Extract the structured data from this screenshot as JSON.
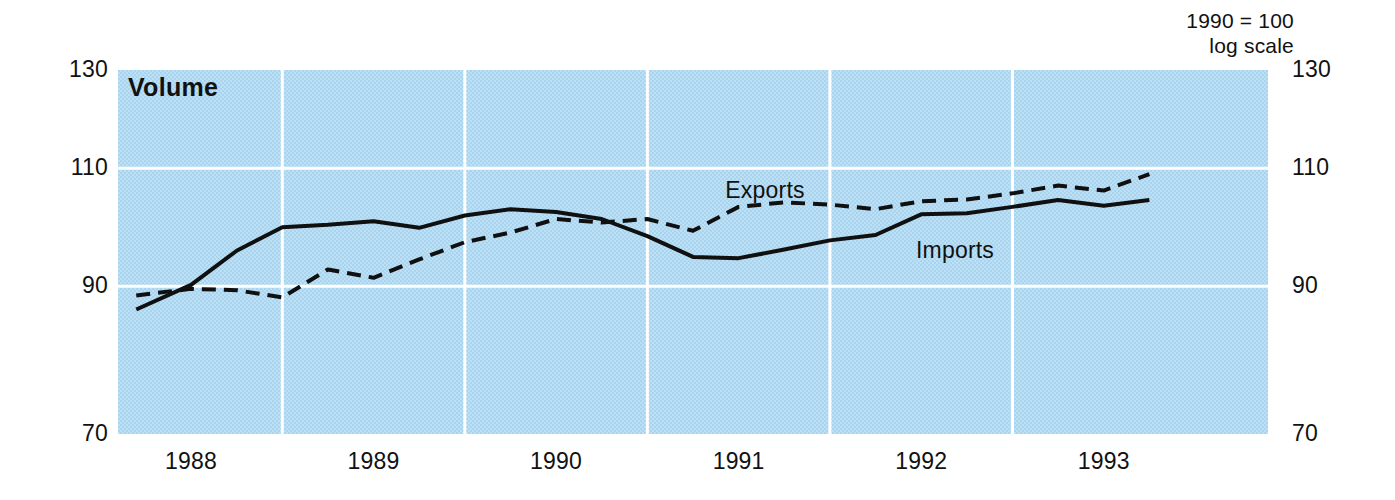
{
  "header": {
    "note_line1": "1990 = 100",
    "note_line2": "log scale"
  },
  "plot": {
    "title": "Volume"
  },
  "series_labels": {
    "exports": "Exports",
    "imports": "Imports"
  },
  "colors": {
    "plot_background": "#b9dcf2",
    "gridline": "#ffffff",
    "line": "#101010",
    "text": "#111111",
    "page_background": "#ffffff"
  },
  "chart_data": {
    "type": "line",
    "title": "Volume",
    "subtitle": "1990 = 100, log scale",
    "xlabel": "",
    "ylabel": "",
    "yscale": "log",
    "ylim": [
      70,
      130
    ],
    "yticks": [
      70,
      90,
      110,
      130
    ],
    "ytick_labels": [
      "70",
      "90",
      "110",
      "130"
    ],
    "ytick_labels_right": [
      "70",
      "90",
      "110",
      "130"
    ],
    "xlim": [
      1987.6,
      1993.9
    ],
    "xticks": [
      1988,
      1989,
      1990,
      1991,
      1992,
      1993
    ],
    "xtick_labels": [
      "1988",
      "1989",
      "1990",
      "1991",
      "1992",
      "1993"
    ],
    "gridlines": {
      "horizontal": [
        90,
        110
      ],
      "vertical": [
        1988.5,
        1989.5,
        1990.5,
        1991.5,
        1992.5
      ],
      "visible": true
    },
    "legend": {
      "position": "inline-annotation",
      "entries": [
        "Exports",
        "Imports"
      ]
    },
    "series": [
      {
        "name": "Exports",
        "style": "dashed",
        "x": [
          1987.7,
          1988.0,
          1988.25,
          1988.5,
          1988.75,
          1989.0,
          1989.25,
          1989.5,
          1989.75,
          1990.0,
          1990.25,
          1990.5,
          1990.75,
          1991.0,
          1991.25,
          1991.5,
          1991.75,
          1992.0,
          1992.25,
          1992.5,
          1992.75,
          1993.0,
          1993.25
        ],
        "values": [
          88.6,
          89.6,
          89.4,
          88.3,
          92.6,
          91.3,
          94.2,
          97.0,
          98.6,
          100.9,
          100.3,
          100.9,
          98.9,
          103.0,
          103.8,
          103.4,
          102.6,
          104.0,
          104.3,
          105.4,
          106.8,
          105.9,
          108.9
        ]
      },
      {
        "name": "Imports",
        "style": "solid",
        "x": [
          1987.7,
          1988.0,
          1988.25,
          1988.5,
          1988.75,
          1989.0,
          1989.25,
          1989.5,
          1989.75,
          1990.0,
          1990.25,
          1990.5,
          1990.75,
          1991.0,
          1991.25,
          1991.5,
          1991.75,
          1992.0,
          1992.25,
          1992.5,
          1992.75,
          1993.0,
          1993.25
        ],
        "values": [
          86.5,
          90.2,
          95.6,
          99.5,
          99.9,
          100.5,
          99.4,
          101.5,
          102.6,
          102.1,
          100.9,
          98.0,
          94.6,
          94.4,
          95.8,
          97.3,
          98.2,
          101.7,
          101.9,
          103.0,
          104.2,
          103.2,
          104.2
        ]
      }
    ]
  }
}
